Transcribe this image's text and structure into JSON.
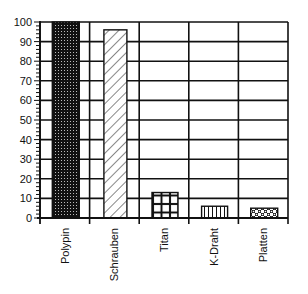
{
  "chart_data": {
    "type": "bar",
    "title": "",
    "xlabel": "",
    "ylabel": "",
    "categories": [
      "Polypin",
      "Schrauben",
      "Titan",
      "K-Draht",
      "Platten"
    ],
    "values": [
      100,
      96,
      13,
      6,
      5
    ],
    "ylim": [
      0,
      100
    ],
    "yticks": [
      0,
      10,
      20,
      30,
      40,
      50,
      60,
      70,
      80,
      90,
      100
    ],
    "grid": true,
    "legend": null,
    "bar_patterns": [
      "dense-dots-dark",
      "diagonal-hatch",
      "square-grid",
      "vertical-lines",
      "checker-dots"
    ]
  },
  "colors": {
    "ink": "#111111",
    "background": "#ffffff"
  }
}
